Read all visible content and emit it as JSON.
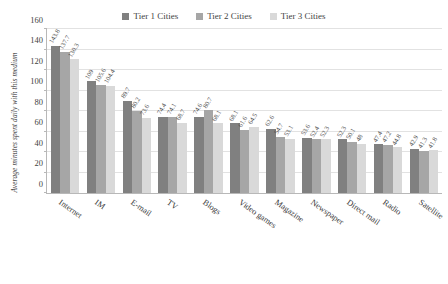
{
  "chart_data": {
    "type": "bar",
    "title": "",
    "xlabel": "",
    "ylabel": "Average minutes spent daily with this medium",
    "ylim": [
      0,
      160
    ],
    "yticks": [
      0,
      20,
      40,
      60,
      80,
      100,
      120,
      140,
      160
    ],
    "grid": true,
    "legend_position": "top-center",
    "categories": [
      "Internet",
      "IM",
      "E-mail",
      "TV",
      "Blogs",
      "Video games",
      "Magazine",
      "Newspaper",
      "Direct mail",
      "Radio",
      "Satellite"
    ],
    "series": [
      {
        "name": "Tier 1 Cities",
        "color": "#808080",
        "values": [
          143.8,
          109,
          89.7,
          74.4,
          74.6,
          68.1,
          62.6,
          53.6,
          52.3,
          47.4,
          42.9
        ]
      },
      {
        "name": "Tier 2 Cities",
        "color": "#a6a6a6",
        "values": [
          137.7,
          105.6,
          80.2,
          74.1,
          80.7,
          61.6,
          54.7,
          52.4,
          50.1,
          47.2,
          41.3
        ]
      },
      {
        "name": "Tier 3 Cities",
        "color": "#d9d9d9",
        "values": [
          130.3,
          104.4,
          73.6,
          68.7,
          68.1,
          64.5,
          53.1,
          52.3,
          48.0,
          44.8,
          41.8
        ]
      }
    ]
  },
  "colors": {
    "tier1": "#808080",
    "tier2": "#a6a6a6",
    "tier3": "#d9d9d9",
    "axis": "#b8b8b8",
    "grid": "#e2e2e2",
    "text": "#3a3a3a"
  }
}
